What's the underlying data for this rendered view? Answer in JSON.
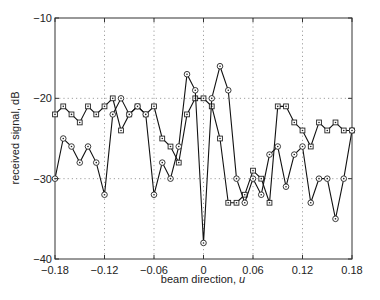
{
  "chart_data": {
    "type": "line",
    "title": "",
    "xlabel": "beam direction, u",
    "xlabel_text": "beam direction, ",
    "xlabel_var": "u",
    "ylabel": "received signal, dB",
    "xlim": [
      -0.18,
      0.18
    ],
    "ylim": [
      -40,
      -10
    ],
    "grid": true,
    "legend": null,
    "x_ticks": [
      -0.18,
      -0.12,
      -0.06,
      0,
      0.06,
      0.12,
      0.18
    ],
    "x_tick_labels": [
      "−0.18",
      "−0.12",
      "−0.06",
      "0",
      "0.06",
      "0.12",
      "0.18"
    ],
    "y_ticks": [
      -10,
      -20,
      -30,
      -40
    ],
    "y_tick_labels": [
      "−10",
      "−20",
      "−30",
      "−40"
    ],
    "x": [
      -0.18,
      -0.17,
      -0.16,
      -0.15,
      -0.14,
      -0.13,
      -0.12,
      -0.11,
      -0.1,
      -0.09,
      -0.08,
      -0.07,
      -0.06,
      -0.05,
      -0.04,
      -0.03,
      -0.02,
      -0.01,
      0.0,
      0.01,
      0.02,
      0.03,
      0.04,
      0.05,
      0.06,
      0.07,
      0.08,
      0.09,
      0.1,
      0.11,
      0.12,
      0.13,
      0.14,
      0.15,
      0.16,
      0.17,
      0.18
    ],
    "series": [
      {
        "name": "squares",
        "marker": "square",
        "values": [
          -22,
          -21,
          -22,
          -23,
          -21,
          -22,
          -21,
          -20,
          -24,
          -22,
          -21,
          -22,
          -21,
          -25,
          -26,
          -28,
          -22,
          -20,
          -20,
          -21,
          -25,
          -33,
          -33,
          -32,
          -29,
          -30,
          -33,
          -21,
          -21,
          -23,
          -24,
          -26,
          -23,
          -24,
          -23,
          -24,
          -24
        ]
      },
      {
        "name": "circles",
        "marker": "circle",
        "values": [
          -30,
          -25,
          -26,
          -28,
          -26,
          -28,
          -32,
          -22,
          -20,
          -22,
          -21,
          -22,
          -32,
          -28,
          -30,
          -26,
          -17,
          -19,
          -38,
          -20,
          -16,
          -19,
          -30,
          -33,
          -30,
          -32,
          -27,
          -26,
          -31,
          -27,
          -26,
          -33,
          -30,
          -30,
          -35,
          -30,
          -24
        ]
      }
    ]
  }
}
